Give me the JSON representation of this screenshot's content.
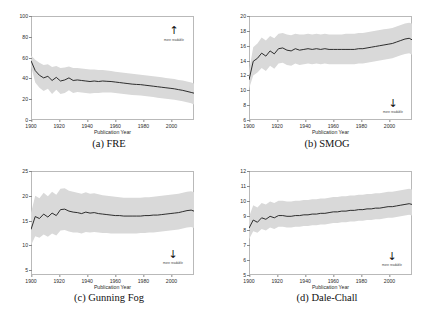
{
  "figure": {
    "x_axis_label": "Publication Year",
    "annotation_up": "more readable",
    "annotation_down": "more readable"
  },
  "panels": [
    {
      "caption": "(a) FRE",
      "arrow_direction": "up",
      "arrow_glyph": "↑",
      "annotation": "more readable"
    },
    {
      "caption": "(b) SMOG",
      "arrow_direction": "down",
      "arrow_glyph": "↓",
      "annotation": "more readable"
    },
    {
      "caption": "(c) Gunning Fog",
      "arrow_direction": "down",
      "arrow_glyph": "↓",
      "annotation": "more readable"
    },
    {
      "caption": "(d) Dale-Chall",
      "arrow_direction": "down",
      "arrow_glyph": "↓",
      "annotation": "more readable"
    }
  ],
  "chart_data": [
    {
      "type": "line",
      "title": "(a) FRE",
      "xlabel": "Publication Year",
      "ylabel": "",
      "xlim": [
        1900,
        2016
      ],
      "ylim": [
        0,
        100
      ],
      "xticks": [
        1900,
        1920,
        1940,
        1960,
        1980,
        2000
      ],
      "yticks": [
        0,
        20,
        40,
        60,
        80,
        100
      ],
      "grid": false,
      "legend": "none",
      "annotations": [
        {
          "text": "more readable",
          "arrow": "up",
          "x": 2006,
          "y": 80
        }
      ],
      "x": [
        1900,
        1903,
        1906,
        1909,
        1912,
        1915,
        1918,
        1921,
        1924,
        1927,
        1930,
        1933,
        1936,
        1939,
        1942,
        1945,
        1948,
        1951,
        1954,
        1957,
        1960,
        1963,
        1966,
        1969,
        1972,
        1975,
        1978,
        1981,
        1984,
        1987,
        1990,
        1993,
        1996,
        1999,
        2002,
        2005,
        2008,
        2011,
        2014,
        2016
      ],
      "series": [
        {
          "name": "mean FRE",
          "values": [
            57.0,
            47.5,
            43.0,
            40.5,
            42.0,
            38.0,
            41.0,
            37.5,
            38.5,
            40.5,
            38.0,
            38.5,
            38.0,
            37.5,
            37.0,
            37.5,
            37.0,
            37.5,
            37.2,
            37.0,
            36.5,
            36.0,
            35.5,
            35.0,
            34.5,
            34.2,
            34.0,
            33.5,
            33.0,
            32.5,
            32.0,
            31.5,
            31.0,
            30.5,
            30.0,
            29.2,
            28.5,
            27.5,
            26.5,
            25.8
          ]
        },
        {
          "name": "upper band",
          "values": [
            62.0,
            58.0,
            55.0,
            53.0,
            53.5,
            51.0,
            52.0,
            50.0,
            50.5,
            51.5,
            50.0,
            50.0,
            49.5,
            49.0,
            48.5,
            48.5,
            48.0,
            48.0,
            47.5,
            47.0,
            46.5,
            46.0,
            45.5,
            45.0,
            44.5,
            44.0,
            43.5,
            43.0,
            42.5,
            42.0,
            41.5,
            41.0,
            40.5,
            40.0,
            39.5,
            38.5,
            38.0,
            37.0,
            36.0,
            35.0
          ]
        },
        {
          "name": "lower band",
          "values": [
            52.0,
            36.0,
            31.0,
            28.0,
            30.0,
            25.0,
            29.0,
            25.0,
            26.0,
            28.5,
            26.0,
            27.0,
            26.5,
            26.0,
            25.5,
            26.0,
            26.0,
            26.5,
            26.5,
            26.5,
            26.0,
            25.5,
            25.0,
            24.5,
            24.0,
            23.8,
            23.5,
            23.0,
            22.5,
            22.0,
            21.5,
            21.0,
            20.5,
            20.0,
            19.5,
            18.8,
            18.0,
            17.0,
            16.0,
            15.0
          ]
        }
      ]
    },
    {
      "type": "line",
      "title": "(b) SMOG",
      "xlabel": "Publication Year",
      "ylabel": "",
      "xlim": [
        1900,
        2016
      ],
      "ylim": [
        6,
        20
      ],
      "xticks": [
        1900,
        1920,
        1940,
        1960,
        1980,
        2000
      ],
      "yticks": [
        6,
        8,
        10,
        12,
        14,
        16,
        18,
        20
      ],
      "grid": false,
      "legend": "none",
      "annotations": [
        {
          "text": "more readable",
          "arrow": "down",
          "x": 2006,
          "y": 8
        }
      ],
      "x": [
        1900,
        1903,
        1906,
        1909,
        1912,
        1915,
        1918,
        1921,
        1924,
        1927,
        1930,
        1933,
        1936,
        1939,
        1942,
        1945,
        1948,
        1951,
        1954,
        1957,
        1960,
        1963,
        1966,
        1969,
        1972,
        1975,
        1978,
        1981,
        1984,
        1987,
        1990,
        1993,
        1996,
        1999,
        2002,
        2005,
        2008,
        2011,
        2014,
        2016
      ],
      "series": [
        {
          "name": "mean SMOG",
          "values": [
            11.4,
            13.9,
            14.3,
            15.0,
            14.6,
            15.3,
            14.9,
            15.6,
            15.7,
            15.4,
            15.3,
            15.6,
            15.4,
            15.5,
            15.6,
            15.5,
            15.6,
            15.5,
            15.6,
            15.5,
            15.5,
            15.5,
            15.5,
            15.5,
            15.5,
            15.5,
            15.6,
            15.6,
            15.7,
            15.8,
            15.9,
            16.0,
            16.1,
            16.2,
            16.3,
            16.5,
            16.7,
            16.9,
            17.0,
            16.8
          ]
        },
        {
          "name": "upper band",
          "values": [
            12.6,
            15.8,
            16.3,
            17.1,
            16.7,
            17.3,
            17.0,
            17.6,
            17.7,
            17.5,
            17.4,
            17.6,
            17.5,
            17.5,
            17.6,
            17.5,
            17.6,
            17.5,
            17.6,
            17.5,
            17.5,
            17.5,
            17.5,
            17.6,
            17.6,
            17.6,
            17.7,
            17.7,
            17.8,
            17.9,
            18.0,
            18.1,
            18.2,
            18.3,
            18.4,
            18.6,
            18.8,
            19.0,
            19.1,
            19.0
          ]
        },
        {
          "name": "lower band",
          "values": [
            10.2,
            12.0,
            12.4,
            13.0,
            12.6,
            13.3,
            12.9,
            13.6,
            13.7,
            13.4,
            13.3,
            13.6,
            13.4,
            13.5,
            13.6,
            13.5,
            13.6,
            13.5,
            13.6,
            13.5,
            13.5,
            13.5,
            13.5,
            13.5,
            13.5,
            13.5,
            13.6,
            13.6,
            13.7,
            13.8,
            13.9,
            14.0,
            14.1,
            14.2,
            14.3,
            14.5,
            14.7,
            14.9,
            15.0,
            14.8
          ]
        }
      ]
    },
    {
      "type": "line",
      "title": "(c) Gunning Fog",
      "xlabel": "Publication Year",
      "ylabel": "",
      "xlim": [
        1900,
        2016
      ],
      "ylim": [
        4,
        25
      ],
      "xticks": [
        1900,
        1920,
        1940,
        1960,
        1980,
        2000
      ],
      "yticks": [
        5,
        10,
        15,
        20,
        25
      ],
      "grid": false,
      "legend": "none",
      "annotations": [
        {
          "text": "more readable",
          "arrow": "down",
          "x": 2006,
          "y": 8
        }
      ],
      "x": [
        1900,
        1903,
        1906,
        1909,
        1912,
        1915,
        1918,
        1921,
        1924,
        1927,
        1930,
        1933,
        1936,
        1939,
        1942,
        1945,
        1948,
        1951,
        1954,
        1957,
        1960,
        1963,
        1966,
        1969,
        1972,
        1975,
        1978,
        1981,
        1984,
        1987,
        1990,
        1993,
        1996,
        1999,
        2002,
        2005,
        2008,
        2011,
        2014,
        2016
      ],
      "series": [
        {
          "name": "mean Gunning Fog",
          "values": [
            13.2,
            15.8,
            15.4,
            16.3,
            15.7,
            16.5,
            16.0,
            17.2,
            17.3,
            16.9,
            16.7,
            16.6,
            16.4,
            16.7,
            16.5,
            16.6,
            16.4,
            16.3,
            16.2,
            16.1,
            16.0,
            16.0,
            15.9,
            15.9,
            15.9,
            15.9,
            15.9,
            16.0,
            16.0,
            16.1,
            16.1,
            16.2,
            16.3,
            16.4,
            16.5,
            16.6,
            16.8,
            17.0,
            17.1,
            16.9
          ]
        },
        {
          "name": "upper band",
          "values": [
            16.5,
            20.0,
            19.5,
            20.6,
            19.9,
            20.8,
            20.2,
            21.4,
            21.5,
            21.0,
            20.8,
            20.6,
            20.4,
            20.7,
            20.4,
            20.5,
            20.3,
            20.1,
            20.0,
            19.9,
            19.8,
            19.7,
            19.6,
            19.6,
            19.6,
            19.6,
            19.6,
            19.7,
            19.7,
            19.8,
            19.9,
            20.0,
            20.1,
            20.2,
            20.3,
            20.4,
            20.6,
            20.8,
            20.9,
            20.7
          ]
        },
        {
          "name": "lower band",
          "values": [
            10.0,
            11.8,
            11.5,
            12.2,
            11.7,
            12.4,
            12.0,
            13.0,
            13.1,
            12.8,
            12.6,
            12.6,
            12.4,
            12.7,
            12.6,
            12.7,
            12.6,
            12.5,
            12.5,
            12.4,
            12.4,
            12.4,
            12.4,
            12.4,
            12.4,
            12.4,
            12.5,
            12.5,
            12.6,
            12.6,
            12.7,
            12.8,
            12.9,
            13.0,
            13.1,
            13.2,
            13.4,
            13.6,
            13.7,
            13.5
          ]
        }
      ]
    },
    {
      "type": "line",
      "title": "(d) Dale-Chall",
      "xlabel": "Publication Year",
      "ylabel": "",
      "xlim": [
        1900,
        2016
      ],
      "ylim": [
        5,
        12
      ],
      "xticks": [
        1900,
        1920,
        1940,
        1960,
        1980,
        2000
      ],
      "yticks": [
        5,
        6,
        7,
        8,
        9,
        10,
        11,
        12
      ],
      "grid": false,
      "legend": "none",
      "annotations": [
        {
          "text": "more readable",
          "arrow": "down",
          "x": 2006,
          "y": 6
        }
      ],
      "x": [
        1900,
        1903,
        1906,
        1909,
        1912,
        1915,
        1918,
        1921,
        1924,
        1927,
        1930,
        1933,
        1936,
        1939,
        1942,
        1945,
        1948,
        1951,
        1954,
        1957,
        1960,
        1963,
        1966,
        1969,
        1972,
        1975,
        1978,
        1981,
        1984,
        1987,
        1990,
        1993,
        1996,
        1999,
        2002,
        2005,
        2008,
        2011,
        2014,
        2016
      ],
      "series": [
        {
          "name": "mean Dale-Chall",
          "values": [
            8.15,
            8.7,
            8.55,
            8.85,
            8.75,
            8.95,
            8.85,
            9.0,
            9.0,
            8.95,
            8.95,
            9.0,
            9.0,
            9.05,
            9.05,
            9.1,
            9.1,
            9.15,
            9.15,
            9.2,
            9.25,
            9.25,
            9.3,
            9.3,
            9.35,
            9.35,
            9.4,
            9.4,
            9.45,
            9.45,
            9.5,
            9.5,
            9.55,
            9.6,
            9.6,
            9.65,
            9.7,
            9.75,
            9.8,
            9.75
          ]
        },
        {
          "name": "upper band",
          "values": [
            8.9,
            9.7,
            9.55,
            9.85,
            9.75,
            9.95,
            9.85,
            10.0,
            10.0,
            9.95,
            9.95,
            10.0,
            10.0,
            10.05,
            10.05,
            10.1,
            10.1,
            10.15,
            10.15,
            10.2,
            10.25,
            10.25,
            10.3,
            10.3,
            10.35,
            10.35,
            10.4,
            10.4,
            10.45,
            10.45,
            10.5,
            10.5,
            10.55,
            10.6,
            10.6,
            10.65,
            10.7,
            10.75,
            10.8,
            10.75
          ]
        },
        {
          "name": "lower band",
          "values": [
            7.4,
            7.95,
            7.85,
            8.1,
            8.0,
            8.2,
            8.1,
            8.25,
            8.25,
            8.2,
            8.2,
            8.25,
            8.25,
            8.3,
            8.3,
            8.35,
            8.35,
            8.4,
            8.4,
            8.45,
            8.5,
            8.5,
            8.55,
            8.55,
            8.6,
            8.6,
            8.65,
            8.65,
            8.7,
            8.7,
            8.75,
            8.75,
            8.8,
            8.85,
            8.85,
            8.9,
            8.95,
            9.0,
            9.05,
            9.0
          ]
        }
      ]
    }
  ],
  "colors": {
    "line": "#1a1a1a",
    "band": "#d9d9d9",
    "axis": "#b9b9b9",
    "background": "#ffffff"
  }
}
